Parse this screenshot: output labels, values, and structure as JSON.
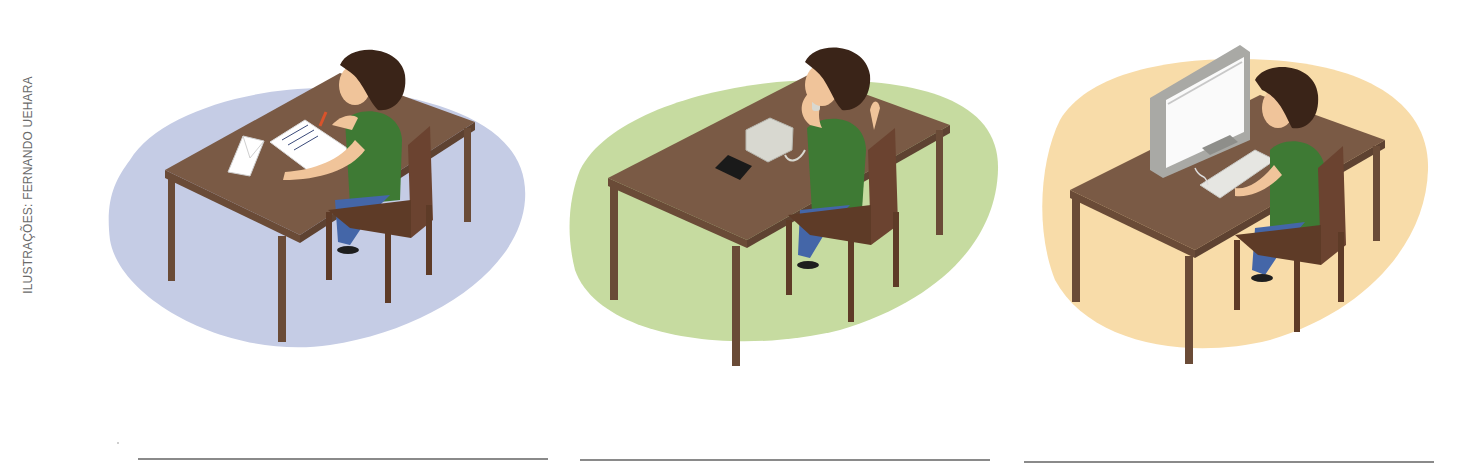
{
  "credit": "ILUSTRAÇÕES: FERNANDO UEHARA",
  "scenes": [
    {
      "id": "letter",
      "description": "Boy at desk writing a letter with an envelope",
      "background_color": "#c5cce5",
      "objects": [
        "letter-paper",
        "envelope",
        "pencil"
      ]
    },
    {
      "id": "phone",
      "description": "Boy at desk talking on a landline telephone",
      "background_color": "#c6dba0",
      "objects": [
        "telephone",
        "wallet"
      ]
    },
    {
      "id": "computer",
      "description": "Boy at desk typing on a computer",
      "background_color": "#f8dca9",
      "objects": [
        "monitor",
        "keyboard"
      ]
    }
  ],
  "colors": {
    "table": "#7a5a45",
    "table_dark": "#6a4b37",
    "chair": "#5e3b27",
    "shirt": "#3e7a34",
    "pants": "#4466a8",
    "hair": "#3a2418",
    "skin": "#f0c49a",
    "answer_line": "#8a8a8a"
  },
  "answer_lines": [
    {
      "x": 138,
      "width": 410
    },
    {
      "x": 580,
      "width": 410
    },
    {
      "x": 1024,
      "width": 410
    }
  ]
}
